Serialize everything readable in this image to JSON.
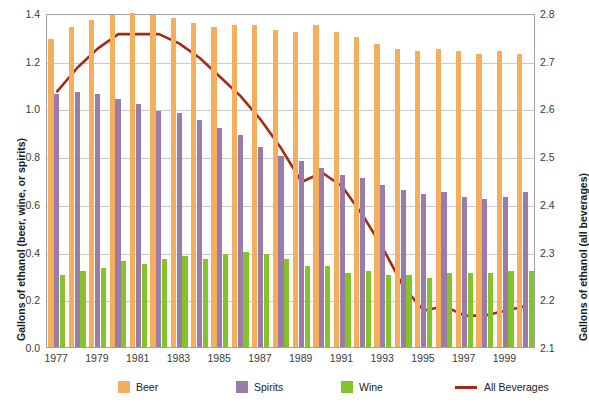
{
  "chart_data": {
    "type": "bar",
    "title": "",
    "subtitle": "",
    "xlabel": "",
    "ylabel": "Gallons of ethanol (beer, wine, or spirits)",
    "ylabel_secondary": "Gallons of ethanol (all beverages)",
    "ylim": [
      0.0,
      1.4
    ],
    "ylim_secondary": [
      2.1,
      2.8
    ],
    "yticks": [
      "0.0",
      "0.2",
      "0.4",
      "0.6",
      "0.8",
      "1.0",
      "1.2",
      "1.4"
    ],
    "yticks_secondary": [
      "2.1",
      "2.2",
      "2.3",
      "2.4",
      "2.5",
      "2.6",
      "2.7",
      "2.8"
    ],
    "grid": true,
    "legend_position": "bottom",
    "categories": [
      "1977",
      "1978",
      "1979",
      "1980",
      "1981",
      "1982",
      "1983",
      "1984",
      "1985",
      "1986",
      "1987",
      "1988",
      "1989",
      "1990",
      "1991",
      "1992",
      "1993",
      "1994",
      "1995",
      "1996",
      "1997",
      "1998",
      "1999",
      "2000"
    ],
    "xtick_labels": [
      "1977",
      "",
      "1979",
      "",
      "1981",
      "",
      "1983",
      "",
      "1985",
      "",
      "1987",
      "",
      "1989",
      "",
      "1991",
      "",
      "1993",
      "",
      "1995",
      "",
      "1997",
      "",
      "1999",
      ""
    ],
    "series": [
      {
        "name": "Beer",
        "type": "bar",
        "color": "#f5ae5c",
        "axis": "left",
        "values": [
          1.29,
          1.34,
          1.37,
          1.39,
          1.4,
          1.39,
          1.38,
          1.36,
          1.34,
          1.35,
          1.35,
          1.33,
          1.32,
          1.35,
          1.32,
          1.3,
          1.27,
          1.25,
          1.24,
          1.25,
          1.24,
          1.23,
          1.24,
          1.23
        ]
      },
      {
        "name": "Spirits",
        "type": "bar",
        "color": "#9b7ba8",
        "axis": "left",
        "values": [
          1.06,
          1.07,
          1.06,
          1.04,
          1.02,
          0.99,
          0.98,
          0.95,
          0.92,
          0.89,
          0.84,
          0.8,
          0.78,
          0.75,
          0.72,
          0.71,
          0.68,
          0.66,
          0.64,
          0.65,
          0.63,
          0.62,
          0.63,
          0.65
        ]
      },
      {
        "name": "Wine",
        "type": "bar",
        "color": "#85c32a",
        "axis": "left",
        "values": [
          0.3,
          0.32,
          0.33,
          0.36,
          0.35,
          0.37,
          0.38,
          0.37,
          0.39,
          0.4,
          0.39,
          0.37,
          0.34,
          0.34,
          0.31,
          0.32,
          0.3,
          0.3,
          0.29,
          0.31,
          0.31,
          0.31,
          0.32,
          0.32
        ]
      },
      {
        "name": "All Beverages",
        "type": "line",
        "color": "#a52a12",
        "axis": "right",
        "values": [
          2.64,
          2.69,
          2.73,
          2.76,
          2.76,
          2.76,
          2.74,
          2.71,
          2.67,
          2.63,
          2.58,
          2.52,
          2.45,
          2.47,
          2.44,
          2.38,
          2.31,
          2.23,
          2.18,
          2.19,
          2.17,
          2.17,
          2.18,
          2.19
        ]
      }
    ],
    "legend": [
      {
        "label": "Beer",
        "color": "#f5ae5c",
        "marker": "square"
      },
      {
        "label": "Spirits",
        "color": "#9b7ba8",
        "marker": "square"
      },
      {
        "label": "Wine",
        "color": "#85c32a",
        "marker": "square"
      },
      {
        "label": "All Beverages",
        "color": "#a52a12",
        "marker": "line"
      }
    ]
  }
}
